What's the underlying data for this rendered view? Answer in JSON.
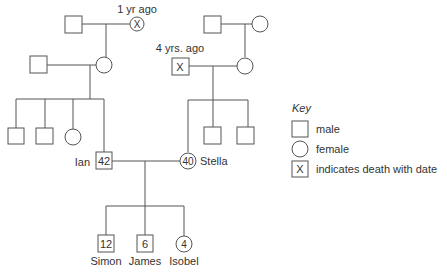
{
  "diagram": {
    "type": "family pedigree",
    "annotations": {
      "maternal_grandmother_death": "1 yr ago",
      "paternal_grandfather_death": "4 yrs. ago"
    },
    "parents": {
      "father": {
        "name": "Ian",
        "age": "42"
      },
      "mother": {
        "name": "Stella",
        "age": "40"
      }
    },
    "children": [
      {
        "name": "Simon",
        "age": "12",
        "sex": "male"
      },
      {
        "name": "James",
        "age": "6",
        "sex": "male"
      },
      {
        "name": "Isobel",
        "age": "4",
        "sex": "female"
      }
    ],
    "death_marker": "X"
  },
  "key": {
    "title": "Key",
    "items": [
      {
        "symbol": "square",
        "label": "male"
      },
      {
        "symbol": "circle",
        "label": "female"
      },
      {
        "symbol": "square-x",
        "label": "indicates death with date"
      }
    ]
  }
}
